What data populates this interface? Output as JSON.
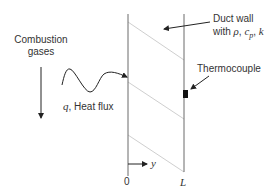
{
  "diagram": {
    "labels": {
      "combustion_line1": "Combustion",
      "combustion_line2": "gases",
      "heat_flux_symbol": "q",
      "heat_flux_text": ", Heat flux",
      "duct_wall_line1": "Duct wall",
      "duct_wall_with": "with ",
      "rho": "ρ",
      "sep1": ", ",
      "cp_c": "c",
      "cp_sub": "p",
      "sep2": ", ",
      "k": "k",
      "thermocouple": "Thermocouple",
      "origin": "0",
      "axis_y": "y",
      "wall_thickness": "L"
    },
    "colors": {
      "line": "#333333",
      "wall": "#666666",
      "hatch": "#c8c8c8",
      "thermocouple": "#111111"
    }
  }
}
